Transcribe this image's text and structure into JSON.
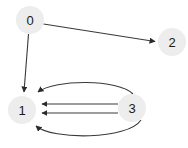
{
  "diagram": {
    "type": "directed-graph",
    "title": "",
    "canvas": {
      "width": 188,
      "height": 148,
      "background": "#ffffff"
    },
    "style": {
      "node_fill": "#ededed",
      "node_radius": 14,
      "label_color": "#1a1a1a",
      "edge_color": "#3a3a3a",
      "edge_width": 1.1
    },
    "nodes": [
      {
        "id": "0",
        "label": "0",
        "cx": 30,
        "cy": 20,
        "r": 14
      },
      {
        "id": "2",
        "label": "2",
        "cx": 172,
        "cy": 42,
        "r": 14
      },
      {
        "id": "1",
        "label": "1",
        "cx": 22,
        "cy": 110,
        "r": 14
      },
      {
        "id": "3",
        "label": "3",
        "cx": 132,
        "cy": 108,
        "r": 14
      }
    ],
    "edges": [
      {
        "from": "0",
        "to": "2",
        "shape": "straight",
        "directed": true
      },
      {
        "from": "0",
        "to": "1",
        "shape": "straight",
        "directed": true
      },
      {
        "from": "3",
        "to": "1",
        "shape": "curve-above",
        "directed": true
      },
      {
        "from": "3",
        "to": "1",
        "shape": "straight-upper",
        "directed": true
      },
      {
        "from": "3",
        "to": "1",
        "shape": "straight-lower",
        "directed": true
      },
      {
        "from": "3",
        "to": "1",
        "shape": "curve-below",
        "directed": true
      }
    ]
  }
}
